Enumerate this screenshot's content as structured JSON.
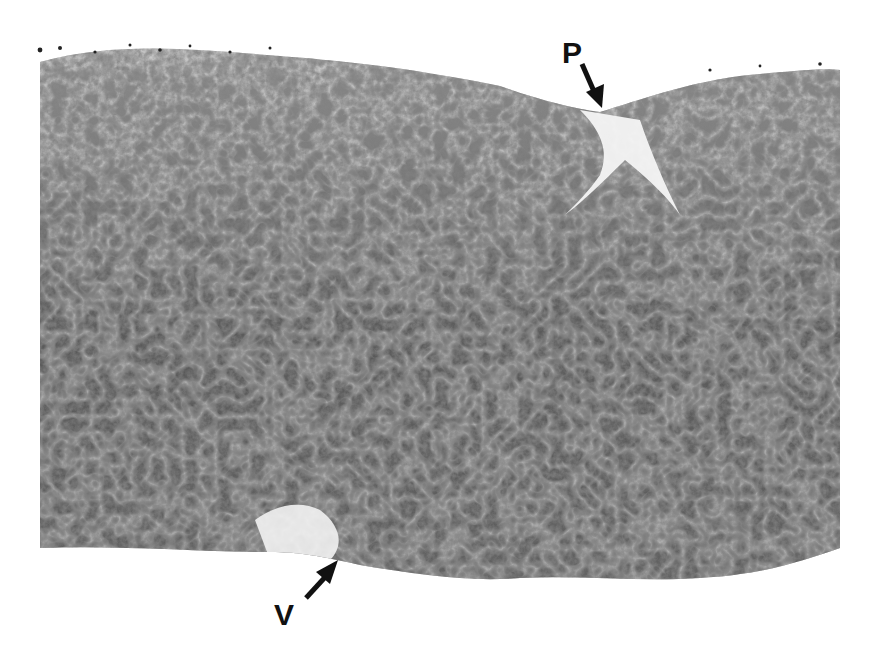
{
  "figure": {
    "type": "grayscale histology micrograph",
    "background": "#ffffff",
    "tissue_tone_dark": "#3a3a3a",
    "tissue_tone_mid": "#777777",
    "tissue_tone_light": "#bdbdbd"
  },
  "annotations": [
    {
      "label": "P",
      "position": "top-right",
      "arrow_direction": "down-right"
    },
    {
      "label": "V",
      "position": "bottom-left",
      "arrow_direction": "up-right"
    }
  ]
}
